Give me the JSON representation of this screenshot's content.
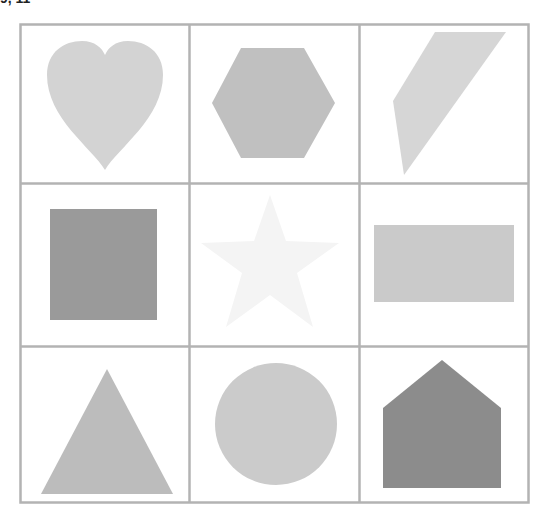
{
  "header": {
    "clipped_label": "9, 11"
  },
  "grid": {
    "rows": 3,
    "cols": 3,
    "border_color": "#b3b3b3",
    "background": "#ffffff"
  },
  "cells": [
    {
      "row": 0,
      "col": 0,
      "shape": "heart",
      "fill": "#d3d3d3"
    },
    {
      "row": 0,
      "col": 1,
      "shape": "hexagon",
      "fill": "#c0c0c0"
    },
    {
      "row": 0,
      "col": 2,
      "shape": "quadrilateral",
      "fill": "#d6d6d6"
    },
    {
      "row": 1,
      "col": 0,
      "shape": "square",
      "fill": "#9a9a9a"
    },
    {
      "row": 1,
      "col": 1,
      "shape": "star",
      "fill": "#f4f4f4"
    },
    {
      "row": 1,
      "col": 2,
      "shape": "rectangle",
      "fill": "#cacaca"
    },
    {
      "row": 2,
      "col": 0,
      "shape": "triangle",
      "fill": "#bcbcbc"
    },
    {
      "row": 2,
      "col": 1,
      "shape": "circle",
      "fill": "#cbcbcb"
    },
    {
      "row": 2,
      "col": 2,
      "shape": "pentagon",
      "fill": "#8c8c8c"
    }
  ]
}
